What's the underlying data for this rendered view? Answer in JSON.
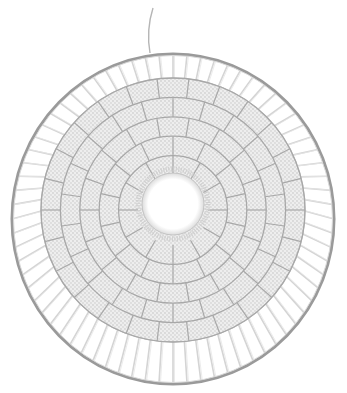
{
  "image": {
    "subject": "woven circular wall hanging",
    "description": "White yarn weaving on a metal hoop with a central hole, concentric rings of woven segments, warp threads radiating to the hoop, and a hanging loop at top",
    "colors": {
      "background": "#ffffff",
      "hoop": "#9a9a9a",
      "warp": "#d4d4d4",
      "weave": "#ececec",
      "weave_shadow": "#bdbdbd",
      "segment_line": "#a8a8a8"
    },
    "geometry": {
      "hoop_center": [
        173,
        219
      ],
      "hoop_rx": 161,
      "hoop_ry": 165,
      "weave_center": [
        173,
        210
      ],
      "weave_radius": 132,
      "hole_center": [
        173,
        204
      ],
      "hole_radius": 31,
      "rings": 5,
      "segments_per_ring": [
        12,
        14,
        18,
        22,
        26
      ],
      "warp_count": 72,
      "hanger": [
        [
          150,
          53
        ],
        [
          146,
          30
        ],
        [
          153,
          8
        ]
      ]
    }
  }
}
